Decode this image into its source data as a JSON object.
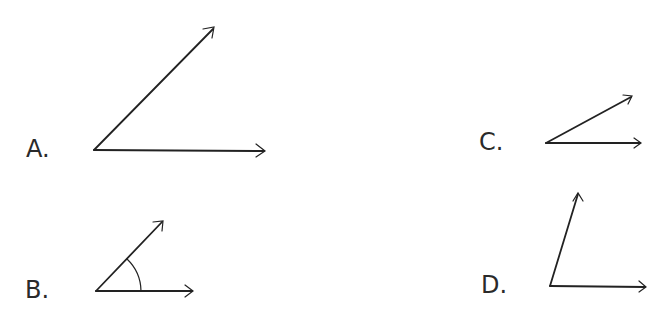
{
  "options": [
    {
      "label": "A.",
      "vertex": [
        94,
        150
      ],
      "ray1_tip": [
        265,
        151
      ],
      "ray2_tip": [
        214,
        28
      ],
      "has_arc": false
    },
    {
      "label": "B.",
      "vertex": [
        96,
        291
      ],
      "ray1_tip": [
        193,
        291
      ],
      "ray2_tip": [
        163,
        221
      ],
      "has_arc": true
    },
    {
      "label": "C.",
      "vertex": [
        546,
        143
      ],
      "ray1_tip": [
        641,
        143
      ],
      "ray2_tip": [
        632,
        96
      ],
      "has_arc": false
    },
    {
      "label": "D.",
      "vertex": [
        550,
        286
      ],
      "ray1_tip": [
        646,
        287
      ],
      "ray2_tip": [
        578,
        193
      ],
      "has_arc": false
    }
  ],
  "colors": {
    "stroke": "#222222",
    "text": "#2a2a2a"
  }
}
